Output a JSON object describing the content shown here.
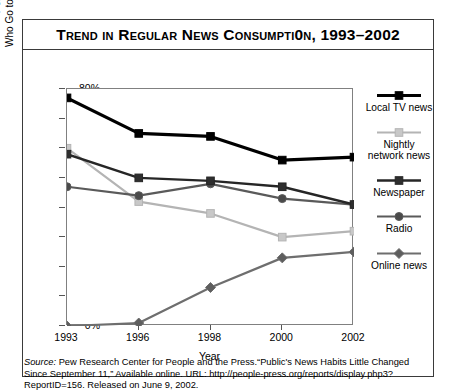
{
  "chart_data": {
    "type": "line",
    "title": "Trend in Regular News Consumpti0n, 1993–2002",
    "xlabel": "Year",
    "ylabel": "Percentage of Adults\nWho Go to These Sources for News",
    "categories": [
      "1993",
      "1996",
      "1998",
      "2000",
      "2002"
    ],
    "ylim": [
      0,
      80
    ],
    "ytick_labels": [
      "0%",
      "10%",
      "20%",
      "30%",
      "40%",
      "50%",
      "60%",
      "70%",
      "80%"
    ],
    "ytick_values": [
      0,
      10,
      20,
      30,
      40,
      50,
      60,
      70,
      80
    ],
    "grid": false,
    "legend_position": "right",
    "series": [
      {
        "name": "Local TV news",
        "values": [
          77,
          65,
          64,
          56,
          57
        ],
        "color": "#000000",
        "marker": "square",
        "marker_fill": "#000000",
        "width": 3.2
      },
      {
        "name": "Nightly\nnetwork news",
        "values": [
          60,
          42,
          38,
          30,
          32
        ],
        "color": "#b4b4b4",
        "marker": "square",
        "marker_fill": "#c8c8c8",
        "width": 2.2
      },
      {
        "name": "Newspaper",
        "values": [
          58,
          50,
          49,
          47,
          41
        ],
        "color": "#262626",
        "marker": "square",
        "marker_fill": "#2e2e2e",
        "width": 2.4
      },
      {
        "name": "Radio",
        "values": [
          47,
          44,
          48,
          43,
          41
        ],
        "color": "#5a5a5a",
        "marker": "circle",
        "marker_fill": "#4a4a4a",
        "width": 2.2
      },
      {
        "name": "Online news",
        "values": [
          0,
          1,
          13,
          23,
          25
        ],
        "color": "#6e6e6e",
        "marker": "diamond",
        "marker_fill": "#5e5e5e",
        "width": 2.2
      }
    ]
  },
  "source": {
    "label": "Source:",
    "text": " Pew Research Center for People and the Press.“Public's News Habits Little Changed Since September 11,” Available online. URL: http://people-press.org/reports/display.php3?ReportID=156. Released on June 9, 2002."
  }
}
